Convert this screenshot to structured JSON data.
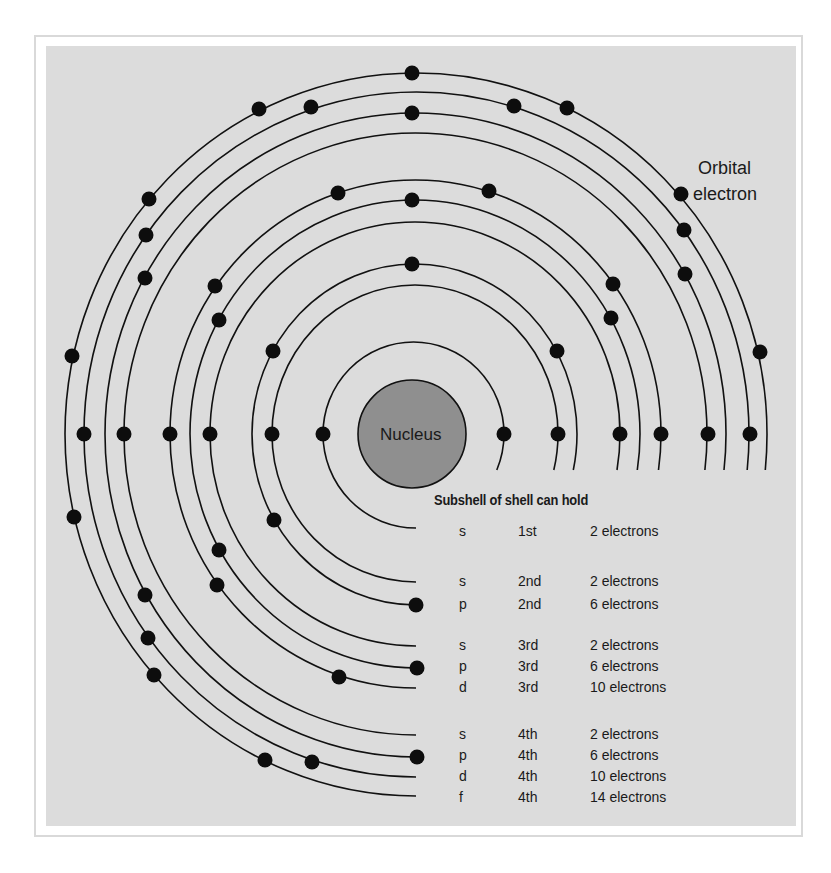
{
  "diagram": {
    "nucleus": {
      "label": "Nucleus",
      "cx": 412,
      "cy": 434,
      "r": 54,
      "fill": "#8f8f8f"
    },
    "callout": {
      "line1": "Orbital",
      "line2": "electron"
    },
    "center": {
      "cx": 416,
      "cy": 434
    },
    "orbitals": [
      {
        "id": "1s",
        "left": 323,
        "right": 504,
        "top": 342,
        "end_y": 528
      },
      {
        "id": "2s",
        "left": 272,
        "right": 558,
        "top": 285,
        "end_y": 582
      },
      {
        "id": "2p",
        "left": 252,
        "right": 577,
        "top": 264,
        "end_y": 605
      },
      {
        "id": "3s",
        "left": 210,
        "right": 620,
        "top": 222,
        "end_y": 646
      },
      {
        "id": "3p",
        "left": 190,
        "right": 640,
        "top": 200,
        "end_y": 668
      },
      {
        "id": "3d",
        "left": 170,
        "right": 661,
        "top": 180,
        "end_y": 688
      },
      {
        "id": "4s",
        "left": 124,
        "right": 707,
        "top": 133,
        "end_y": 735
      },
      {
        "id": "4p",
        "left": 105,
        "right": 726,
        "top": 113,
        "end_y": 757
      },
      {
        "id": "4d",
        "left": 84,
        "right": 749,
        "top": 92,
        "end_y": 777
      },
      {
        "id": "4f",
        "left": 65,
        "right": 767,
        "top": 73,
        "end_y": 796
      }
    ],
    "electrons": [
      [
        412,
        73
      ],
      [
        259,
        109
      ],
      [
        311,
        107
      ],
      [
        514,
        106
      ],
      [
        567,
        108
      ],
      [
        412,
        113
      ],
      [
        338,
        193
      ],
      [
        489,
        191
      ],
      [
        412,
        200
      ],
      [
        412,
        264
      ],
      [
        149,
        199
      ],
      [
        146,
        235
      ],
      [
        145,
        278
      ],
      [
        215,
        286
      ],
      [
        219,
        320
      ],
      [
        273,
        351
      ],
      [
        72,
        356
      ],
      [
        681,
        194
      ],
      [
        684,
        230
      ],
      [
        685,
        274
      ],
      [
        613,
        284
      ],
      [
        611,
        318
      ],
      [
        760,
        352
      ],
      [
        557,
        351
      ],
      [
        84,
        434
      ],
      [
        124,
        434
      ],
      [
        170,
        434
      ],
      [
        210,
        434
      ],
      [
        272,
        434
      ],
      [
        323,
        434
      ],
      [
        504,
        434
      ],
      [
        558,
        434
      ],
      [
        620,
        434
      ],
      [
        661,
        434
      ],
      [
        708,
        434
      ],
      [
        750,
        434
      ],
      [
        74,
        517
      ],
      [
        274,
        520
      ],
      [
        219,
        550
      ],
      [
        217,
        585
      ],
      [
        145,
        595
      ],
      [
        148,
        638
      ],
      [
        154,
        675
      ],
      [
        339,
        677
      ],
      [
        265,
        760
      ],
      [
        312,
        762
      ],
      [
        416,
        605
      ],
      [
        417,
        668
      ],
      [
        417,
        757
      ]
    ]
  },
  "table": {
    "header": "Subshell of shell can hold",
    "rows": [
      {
        "subshell": "s",
        "shell": "1st",
        "capacity": "2 electrons",
        "y": 532
      },
      {
        "subshell": "s",
        "shell": "2nd",
        "capacity": "2 electrons",
        "y": 582
      },
      {
        "subshell": "p",
        "shell": "2nd",
        "capacity": "6 electrons",
        "y": 605
      },
      {
        "subshell": "s",
        "shell": "3rd",
        "capacity": "2 electrons",
        "y": 646
      },
      {
        "subshell": "p",
        "shell": "3rd",
        "capacity": "6 electrons",
        "y": 667
      },
      {
        "subshell": "d",
        "shell": "3rd",
        "capacity": "10 electrons",
        "y": 688
      },
      {
        "subshell": "s",
        "shell": "4th",
        "capacity": "2 electrons",
        "y": 735
      },
      {
        "subshell": "p",
        "shell": "4th",
        "capacity": "6 electrons",
        "y": 756
      },
      {
        "subshell": "d",
        "shell": "4th",
        "capacity": "10 electrons",
        "y": 777
      },
      {
        "subshell": "f",
        "shell": "4th",
        "capacity": "14 electrons",
        "y": 798
      }
    ]
  },
  "colors": {
    "panel": "#dcdcdc",
    "frame_border": "#d9d9d9",
    "ink": "#111111",
    "nucleus": "#8f8f8f"
  }
}
